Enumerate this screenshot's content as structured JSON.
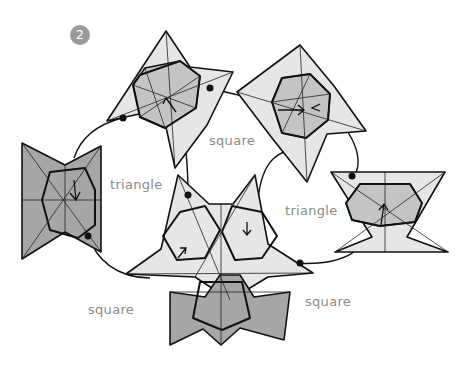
{
  "step": {
    "number": "2",
    "badge_color": "#9a9a9a"
  },
  "labels": {
    "square_top": "square",
    "triangle_left": "triangle",
    "triangle_right": "triangle",
    "square_bottom_left": "square",
    "square_bottom_right": "square"
  },
  "colors": {
    "light_paper": "#e6e6e6",
    "dark_paper": "#a6a6a6",
    "label_text": "#8a8a8a",
    "line": "#111111"
  },
  "units": [
    {
      "id": "top-left-unit",
      "shade": "light"
    },
    {
      "id": "top-right-unit",
      "shade": "light"
    },
    {
      "id": "left-unit",
      "shade": "dark"
    },
    {
      "id": "right-unit",
      "shade": "light"
    },
    {
      "id": "center-assembly",
      "shade": "light+dark"
    }
  ]
}
